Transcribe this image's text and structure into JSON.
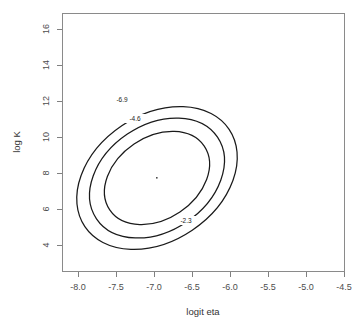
{
  "chart_data": {
    "type": "contour",
    "title": "",
    "xlabel": "logit eta",
    "ylabel": "log K",
    "xlim": [
      -8.25,
      -4.3
    ],
    "ylim": [
      3.0,
      17.2
    ],
    "grid": false,
    "legend": "none",
    "xticks": [
      "-8.0",
      "-7.5",
      "-7.0",
      "-6.5",
      "-6.0",
      "-5.5",
      "-5.0",
      "-4.5"
    ],
    "xtick_values": [
      -8.0,
      -7.5,
      -7.0,
      -6.5,
      -6.0,
      -5.5,
      -5.0,
      -4.5
    ],
    "yticks": [
      "4",
      "6",
      "8",
      "10",
      "12",
      "14",
      "16"
    ],
    "ytick_values": [
      4,
      6,
      8,
      10,
      12,
      14,
      16
    ],
    "center": {
      "x": -6.88,
      "y": 7.8
    },
    "contours": [
      {
        "level": "-2.3",
        "label": "-2.3",
        "rx": 57,
        "ry": 41,
        "rotation": -34,
        "label_x": 186,
        "label_y": 221
      },
      {
        "level": "-4.6",
        "label": "-4.6",
        "rx": 73,
        "ry": 53,
        "rotation": -34,
        "label_x": 135,
        "label_y": 119
      },
      {
        "level": "-6.9",
        "label": "-6.9",
        "rx": 87,
        "ry": 63,
        "rotation": -34,
        "label_x": 122,
        "label_y": 100
      }
    ]
  },
  "axes": {
    "x_title": "logit eta",
    "y_title": "log K"
  }
}
